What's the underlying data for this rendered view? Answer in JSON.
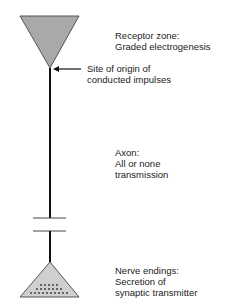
{
  "diagram": {
    "type": "neuron-functional-zones",
    "colors": {
      "line": "#111111",
      "receptor_fill": "#a9a9a9",
      "ending_fill": "#cfcfcf",
      "dot": "#333333",
      "text": "#222222"
    },
    "labels": {
      "receptor": {
        "line1": "Receptor zone:",
        "line2": "Graded electrogenesis"
      },
      "origin": {
        "line1": "Site of origin of",
        "line2": "conducted impulses"
      },
      "axon": {
        "line1": "Axon:",
        "line2": "All or none",
        "line3": "transmission"
      },
      "endings": {
        "line1": "Nerve endings:",
        "line2": "Secretion of",
        "line3": "synaptic transmitter"
      }
    }
  }
}
